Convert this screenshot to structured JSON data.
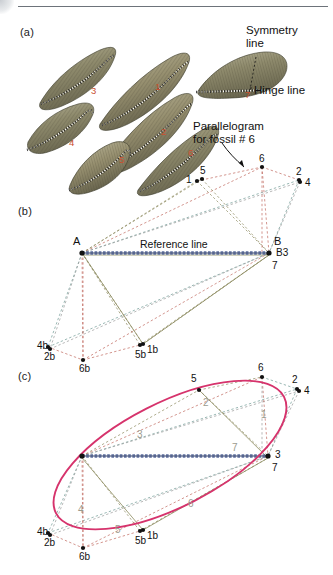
{
  "figure": {
    "panels": [
      {
        "id": "a",
        "label": "(a)",
        "x": 20,
        "y": 26
      },
      {
        "id": "b",
        "label": "(b)",
        "x": 18,
        "y": 205
      },
      {
        "id": "c",
        "label": "(c)",
        "x": 18,
        "y": 370
      }
    ],
    "colors": {
      "ellipse": "#d6336c",
      "reference_line": "#5b6d9e",
      "fossil_number": "#c94f2e",
      "edge_label": "#9b9b8e",
      "dash_olive": "#8c8a5e",
      "dash_red": "#c0695f",
      "dash_teal": "#6f9a93",
      "dash_gray": "#9a9a9a",
      "point": "#111111",
      "text": "#111111",
      "rule": "#6d737a"
    }
  },
  "panel_a": {
    "label": "(a)",
    "annotations": [
      {
        "name": "symmetry-line-label",
        "text": "Symmetry",
        "x": 246,
        "y": 24
      },
      {
        "name": "symmetry-line-label-2",
        "text": "line",
        "x": 246,
        "y": 37
      },
      {
        "name": "hinge-line-label",
        "text": "Hinge line",
        "x": 254,
        "y": 84
      },
      {
        "name": "parallelogram-label-1",
        "text": "Parallelogram",
        "x": 193,
        "y": 120
      },
      {
        "name": "parallelogram-label-2",
        "text": "for fossil # 6",
        "x": 193,
        "y": 133
      }
    ],
    "fossil_numbers": [
      {
        "id": "3",
        "x": 91,
        "y": 86
      },
      {
        "id": "1",
        "x": 155,
        "y": 82
      },
      {
        "id": "7",
        "x": 245,
        "y": 120
      },
      {
        "id": "2",
        "x": 161,
        "y": 127
      },
      {
        "id": "4",
        "x": 69,
        "y": 138
      },
      {
        "id": "5",
        "x": 119,
        "y": 155
      },
      {
        "id": "6",
        "x": 188,
        "y": 148
      }
    ],
    "specimens": [
      {
        "id": "3",
        "desc": "fossil-shell-3"
      },
      {
        "id": "1",
        "desc": "fossil-shell-1"
      },
      {
        "id": "7",
        "desc": "fossil-shell-7"
      },
      {
        "id": "2",
        "desc": "fossil-shell-2"
      },
      {
        "id": "4",
        "desc": "fossil-shell-4"
      },
      {
        "id": "5",
        "desc": "fossil-shell-5"
      },
      {
        "id": "6",
        "desc": "fossil-shell-6"
      }
    ]
  },
  "panel_b": {
    "label": "(b)",
    "reference_line_label": "Reference line",
    "reference_line": {
      "x1": 82,
      "y1": 253,
      "x2": 269,
      "y2": 253
    },
    "anchor_labels": [
      {
        "name": "anchor-A",
        "text": "A",
        "x": 73,
        "y": 238
      },
      {
        "name": "anchor-B",
        "text": "B",
        "x": 274,
        "y": 238
      }
    ],
    "points": [
      {
        "id": "1",
        "x": 197,
        "y": 181,
        "label_x": 186,
        "label_y": 175
      },
      {
        "id": "5",
        "x": 202,
        "y": 179,
        "label_x": 200,
        "label_y": 166
      },
      {
        "id": "6",
        "x": 262,
        "y": 167,
        "label_x": 259,
        "label_y": 154
      },
      {
        "id": "2",
        "x": 299,
        "y": 180,
        "label_x": 296,
        "label_y": 167
      },
      {
        "id": "4",
        "x": 300,
        "y": 182,
        "label_x": 305,
        "label_y": 178
      },
      {
        "id": "A",
        "x": 82,
        "y": 253,
        "label_x": 73,
        "label_y": 238
      },
      {
        "id": "B3",
        "x": 269,
        "y": 253,
        "label_x": 274,
        "label_y": 248
      },
      {
        "id": "7",
        "x": 269,
        "y": 255,
        "label_x": 272,
        "label_y": 261
      },
      {
        "id": "4b",
        "x": 48,
        "y": 347,
        "label_x": 38,
        "label_y": 341
      },
      {
        "id": "2b",
        "x": 50,
        "y": 349,
        "label_x": 45,
        "label_y": 353
      },
      {
        "id": "6b",
        "x": 83,
        "y": 360,
        "label_x": 79,
        "label_y": 365
      },
      {
        "id": "5b",
        "x": 140,
        "y": 345,
        "label_x": 136,
        "label_y": 350
      },
      {
        "id": "1b",
        "x": 143,
        "y": 344,
        "label_x": 148,
        "label_y": 345
      }
    ]
  },
  "panel_c": {
    "label": "(c)",
    "ellipse": {
      "cx": 170,
      "cy": 455,
      "rx": 128,
      "ry": 52,
      "rotation": -27
    },
    "reference_line": {
      "x1": 82,
      "y1": 456,
      "x2": 268,
      "y2": 456
    },
    "points": [
      {
        "id": "5",
        "x": 199,
        "y": 390,
        "label_x": 191,
        "label_y": 374
      },
      {
        "id": "6",
        "x": 262,
        "y": 377,
        "label_x": 258,
        "label_y": 363
      },
      {
        "id": "2",
        "x": 297,
        "y": 389,
        "label_x": 292,
        "label_y": 375
      },
      {
        "id": "4",
        "x": 299,
        "y": 391,
        "label_x": 304,
        "label_y": 386
      },
      {
        "id": "3",
        "x": 268,
        "y": 456,
        "label_x": 274,
        "label_y": 450
      },
      {
        "id": "7",
        "x": 268,
        "y": 458,
        "label_x": 272,
        "label_y": 463
      },
      {
        "id": "4b",
        "x": 48,
        "y": 533,
        "label_x": 38,
        "label_y": 527
      },
      {
        "id": "2b",
        "x": 50,
        "y": 535,
        "label_x": 45,
        "label_y": 539
      },
      {
        "id": "6b",
        "x": 83,
        "y": 548,
        "label_x": 79,
        "label_y": 553
      },
      {
        "id": "5b",
        "x": 140,
        "y": 531,
        "label_x": 136,
        "label_y": 537
      },
      {
        "id": "1b",
        "x": 143,
        "y": 530,
        "label_x": 148,
        "label_y": 531
      }
    ],
    "edge_labels": [
      {
        "id": "1",
        "text": "1",
        "x": 261,
        "y": 410
      },
      {
        "id": "2",
        "text": "2",
        "x": 203,
        "y": 398
      },
      {
        "id": "3",
        "text": "3",
        "x": 137,
        "y": 430
      },
      {
        "id": "7",
        "text": "7",
        "x": 232,
        "y": 443
      },
      {
        "id": "4",
        "text": "4",
        "x": 78,
        "y": 505
      },
      {
        "id": "5",
        "text": "5",
        "x": 115,
        "y": 525
      },
      {
        "id": "6",
        "text": "6",
        "x": 188,
        "y": 499
      }
    ]
  }
}
